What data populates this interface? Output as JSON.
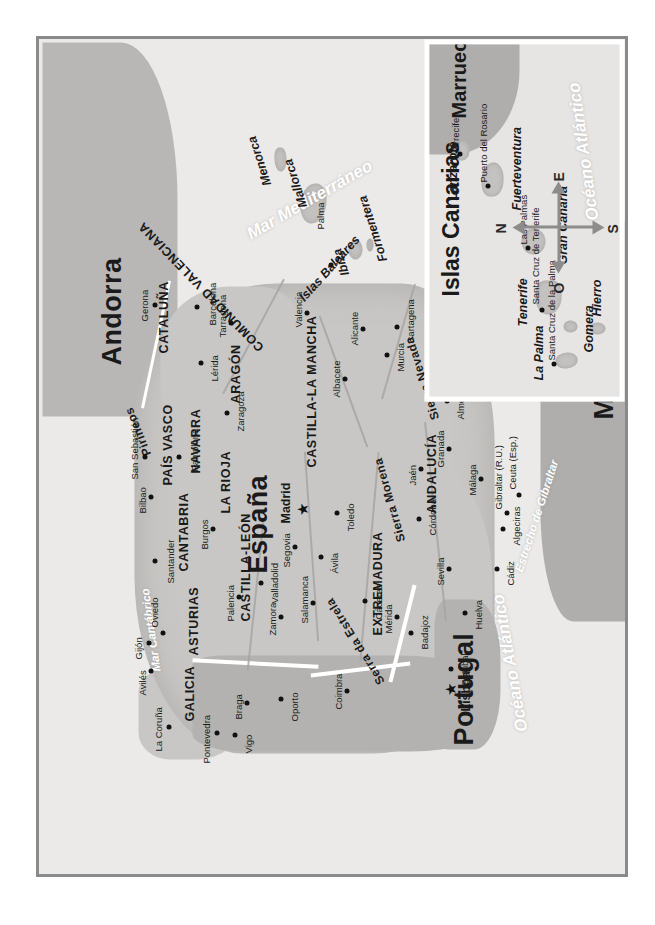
{
  "map": {
    "title_countries": [
      "España",
      "Portugal",
      "Andorra",
      "Marruecos"
    ],
    "colors": {
      "spain_land": "#c9c7c5",
      "portugal_land": "#b4b2b0",
      "france_land": "#b9b7b5",
      "morocco_land": "#b0aeac",
      "water": "#eceae8",
      "frame": "#8a8a8a",
      "inset_border": "#ffffff",
      "label_text": "#1a1a1a",
      "sea_text": "#ffffff"
    },
    "countries": [
      {
        "name": "España",
        "size": "large"
      },
      {
        "name": "Portugal",
        "size": "large"
      },
      {
        "name": "Andorra",
        "size": "large"
      },
      {
        "name": "Marruecos",
        "size": "large"
      }
    ],
    "capitals": [
      {
        "name": "Madrid",
        "symbol": "star"
      },
      {
        "name": "Lisboa",
        "symbol": "star"
      }
    ],
    "regions": [
      "GALICIA",
      "ASTURIAS",
      "CANTABRIA",
      "PAÍS VASCO",
      "NAVARRA",
      "LA RIOJA",
      "ARAGÓN",
      "CATALUÑA",
      "CASTILLA-LEÓN",
      "COMUNIDAD VALENCIANA",
      "CASTILLA-LA MANCHA",
      "EXTREMADURA",
      "ANDALUCÍA"
    ],
    "mountain_ranges": [
      "Pirineos",
      "Sierra Morena",
      "Sierra Nevada",
      "Serra da Estrela"
    ],
    "cities": [
      "La Coruña",
      "Pontevedra",
      "Vigo",
      "Avilés",
      "Gijón",
      "Oviedo",
      "Santander",
      "Bilbao",
      "San Sebastián",
      "Pamplona",
      "Burgos",
      "Palencia",
      "Valladolid",
      "Zamora",
      "Salamanca",
      "Segovia",
      "Ávila",
      "Zaragoza",
      "Lérida",
      "Gerona",
      "Barcelona",
      "Tarragona",
      "Valencia",
      "Albacete",
      "Alicante",
      "Murcia",
      "Cartagena",
      "Toledo",
      "Cáceres",
      "Mérida",
      "Badajoz",
      "Huelva",
      "Sevilla",
      "Córdoba",
      "Jaén",
      "Granada",
      "Almería",
      "Málaga",
      "Cádiz",
      "Algeciras",
      "Oporto",
      "Braga",
      "Coimbra",
      "Setúbal"
    ],
    "territories": [
      "Gibraltar (R.U.)",
      "Ceuta (Esp.)",
      "Melilla (Esp.)"
    ],
    "water_bodies": [
      "Océano Atlántico",
      "Mar Mediterráneo",
      "Mar Cantábrico",
      "Estrecho de Gibraltar",
      "Océano Atlántico"
    ],
    "island_groups": {
      "balearic": {
        "label": "Islas Baleares",
        "islands": [
          "Menorca",
          "Mallorca",
          "Ibiza",
          "Formentera"
        ],
        "cities": [
          "Palma"
        ]
      },
      "canary": {
        "title": "Islas Canarias",
        "islands": [
          "La Palma",
          "Tenerife",
          "Gomera",
          "Hierro",
          "Gran Canaria",
          "Fuerteventura",
          "Lanzarote"
        ],
        "cities": [
          "Santa Cruz de la Palma",
          "Santa Cruz de Tenerife",
          "Las Palmas",
          "Puerto del Rosario",
          "Arrecife"
        ],
        "neighbour": "Marruecos",
        "ocean": "Océano Atlántico"
      }
    },
    "compass": {
      "north": "N",
      "south": "S",
      "east": "E",
      "west": "O"
    }
  }
}
